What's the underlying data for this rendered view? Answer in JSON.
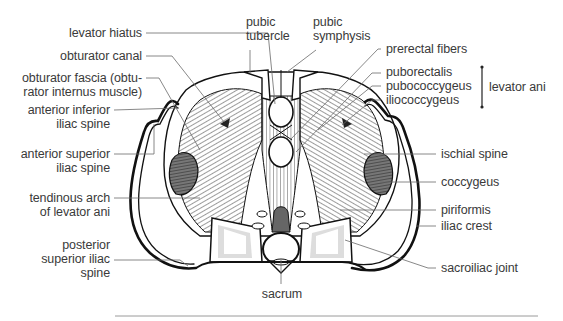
{
  "diagram": {
    "type": "anatomical-illustration",
    "colors": {
      "label_text": "#3a3a3a",
      "leader_line": "#6a6a6a",
      "outline": "#111111",
      "muscle_shade": "#555555",
      "rule": "#9a9a9a"
    },
    "labels_left": [
      {
        "id": "levator-hiatus",
        "lines": [
          "levator hiatus"
        ]
      },
      {
        "id": "obturator-canal",
        "lines": [
          "obturator canal"
        ]
      },
      {
        "id": "obturator-fascia",
        "lines": [
          "obturator fascia (obtu-",
          "rator internus muscle)"
        ]
      },
      {
        "id": "anterior-inferior-iliac-spine",
        "lines": [
          "anterior inferior",
          "iliac spine"
        ]
      },
      {
        "id": "anterior-superior-iliac-spine",
        "lines": [
          "anterior superior",
          "iliac spine"
        ]
      },
      {
        "id": "tendinous-arch",
        "lines": [
          "tendinous arch",
          "of levator ani"
        ]
      },
      {
        "id": "posterior-superior-iliac-spine",
        "lines": [
          "posterior",
          "superior iliac",
          "spine"
        ]
      }
    ],
    "labels_top": [
      {
        "id": "pubic-tubercle",
        "lines": [
          "pubic",
          "tubercle"
        ]
      },
      {
        "id": "pubic-symphysis",
        "lines": [
          "pubic",
          "symphysis"
        ]
      }
    ],
    "labels_right": [
      {
        "id": "prerectal-fibers",
        "lines": [
          "prerectal fibers"
        ]
      },
      {
        "id": "puborectalis",
        "lines": [
          "puborectalis"
        ]
      },
      {
        "id": "pubococcygeus",
        "lines": [
          "pubococcygeus"
        ]
      },
      {
        "id": "iliococcygeus",
        "lines": [
          "iliococcygeus"
        ]
      },
      {
        "id": "ischial-spine",
        "lines": [
          "ischial spine"
        ]
      },
      {
        "id": "coccygeus",
        "lines": [
          "coccygeus"
        ]
      },
      {
        "id": "piriformis",
        "lines": [
          "piriformis"
        ]
      },
      {
        "id": "iliac-crest",
        "lines": [
          "iliac crest"
        ]
      },
      {
        "id": "sacroiliac-joint",
        "lines": [
          "sacroiliac joint"
        ]
      }
    ],
    "group_bracket": {
      "label": "levator ani",
      "members": [
        "puborectalis",
        "pubococcygeus",
        "iliococcygeus"
      ]
    },
    "labels_bottom": [
      {
        "id": "sacrum",
        "lines": [
          "sacrum"
        ]
      }
    ]
  }
}
